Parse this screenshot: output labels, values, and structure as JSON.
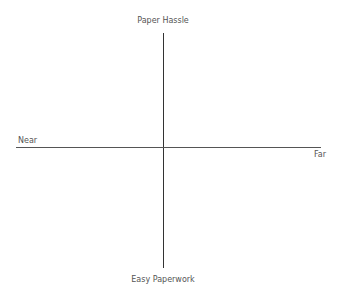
{
  "diagram": {
    "type": "quadrant-axes",
    "axes": {
      "vertical": {
        "top_label": "Paper Hassle",
        "bottom_label": "Easy Paperwork"
      },
      "horizontal": {
        "left_label": "Near",
        "right_label": "Far"
      }
    },
    "colors": {
      "axis_line": "#333333",
      "text": "#555555",
      "background": "#ffffff"
    }
  }
}
